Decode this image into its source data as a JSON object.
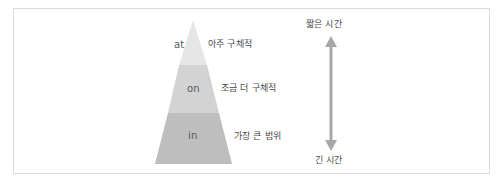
{
  "diagram": {
    "type": "pyramid-with-time-scale",
    "layers": [
      {
        "prep": "at",
        "description": "아주 구체적",
        "color": "#e6e6e6"
      },
      {
        "prep": "on",
        "description": "조금 더 구체적",
        "color": "#d2d2d2"
      },
      {
        "prep": "in",
        "description": "가장 큰 범위",
        "color": "#bdbdbd"
      }
    ],
    "time_axis": {
      "top_label": "짧은 시간",
      "bottom_label": "긴 시간",
      "arrow_color": "#a8a8a8",
      "arrow_icon": "double-headed-vertical-arrow"
    },
    "frame_border_color": "#dcdcdc"
  }
}
